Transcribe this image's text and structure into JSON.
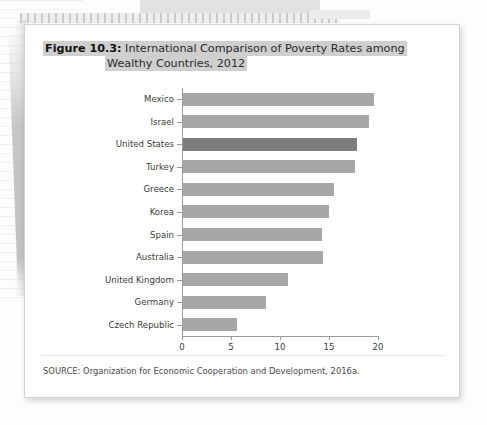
{
  "document": {
    "kind": "scanned-textbook-figure"
  },
  "figure": {
    "label": "Figure 10.3:",
    "title_line_1": "International Comparison of Poverty Rates among",
    "title_line_2": "Wealthy Countries, 2012",
    "source": "SOURCE: Organization for Economic Cooperation and Development, 2016a.",
    "highlight_color": "#cfcfcf",
    "bar_color": "#a7a7a7",
    "bar_highlight_color": "#7d7d7d"
  },
  "chart_data": {
    "type": "bar",
    "orientation": "horizontal",
    "title": "Figure 10.3: International Comparison of Poverty Rates among Wealthy Countries, 2012",
    "xlabel": "",
    "ylabel": "",
    "xlim": [
      0,
      20
    ],
    "xticks": [
      0,
      5,
      10,
      15,
      20
    ],
    "xtick_labels": [
      "0",
      "5",
      "10",
      "15",
      "20"
    ],
    "grid": false,
    "legend": null,
    "highlighted_category": "United States",
    "categories": [
      "Mexico",
      "Israel",
      "United States",
      "Turkey",
      "Greece",
      "Korea",
      "Spain",
      "Australia",
      "United Kingdom",
      "Germany",
      "Czech Republic"
    ],
    "values": [
      19.5,
      19.0,
      17.8,
      17.5,
      15.4,
      14.9,
      14.2,
      14.3,
      10.7,
      8.5,
      5.5
    ],
    "source": "Organization for Economic Cooperation and Development, 2016a."
  }
}
